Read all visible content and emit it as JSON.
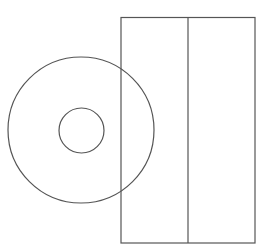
{
  "canvas": {
    "width": 277,
    "height": 250,
    "background": "#ffffff"
  },
  "stroke": {
    "color": "#555555",
    "width": 1.2
  },
  "shapes": {
    "outer_circle": {
      "cx": 81,
      "cy": 130,
      "r": 73
    },
    "inner_circle": {
      "cx": 81.5,
      "cy": 130.5,
      "r": 22.5
    },
    "rectangle": {
      "x": 121,
      "y": 17.5,
      "width": 134,
      "height": 225.5
    },
    "divider": {
      "x1": 188,
      "y1": 17.5,
      "x2": 188,
      "y2": 243
    }
  }
}
